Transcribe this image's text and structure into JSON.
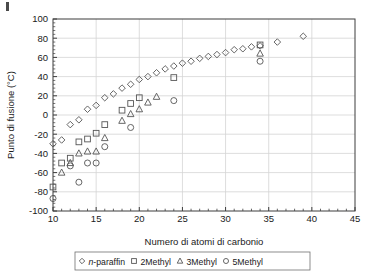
{
  "chart_data": {
    "type": "scatter",
    "title": "",
    "xlabel": "Numero di atomi di carbonio",
    "ylabel": "Punto di fusione (°C)",
    "xlim": [
      10,
      45
    ],
    "ylim": [
      -100,
      100
    ],
    "xticks": [
      10,
      15,
      20,
      25,
      30,
      35,
      40,
      45
    ],
    "yticks": [
      -100,
      -80,
      -60,
      -40,
      -20,
      0,
      20,
      40,
      60,
      80,
      100
    ],
    "xtick_labels": [
      "10",
      "15",
      "20",
      "25",
      "30",
      "35",
      "40",
      "45"
    ],
    "ytick_labels": [
      "-100",
      "-80",
      "-60",
      "-40",
      "-20",
      "0",
      "20",
      "40",
      "60",
      "80",
      "100"
    ],
    "x_minor_tick_step": 1,
    "y_minor_tick_step": 4,
    "grid": true,
    "grid_color": "#d4d4d4",
    "legend_position": "below-axis",
    "marker_color": "#555555",
    "series": [
      {
        "name": "n-paraffin",
        "marker": "diamond",
        "points": [
          [
            10,
            -30
          ],
          [
            11,
            -26
          ],
          [
            12,
            -10
          ],
          [
            13,
            -5
          ],
          [
            14,
            6
          ],
          [
            15,
            10
          ],
          [
            16,
            18
          ],
          [
            17,
            22
          ],
          [
            18,
            28
          ],
          [
            19,
            32
          ],
          [
            20,
            37
          ],
          [
            21,
            40
          ],
          [
            22,
            44
          ],
          [
            23,
            48
          ],
          [
            24,
            51
          ],
          [
            25,
            54
          ],
          [
            26,
            56
          ],
          [
            27,
            59
          ],
          [
            28,
            61
          ],
          [
            29,
            63
          ],
          [
            30,
            65
          ],
          [
            31,
            68
          ],
          [
            32,
            69
          ],
          [
            33,
            71
          ],
          [
            34,
            72
          ],
          [
            36,
            76
          ],
          [
            39,
            82
          ]
        ]
      },
      {
        "name": "2Methyl",
        "marker": "square",
        "points": [
          [
            10,
            -75
          ],
          [
            11,
            -50
          ],
          [
            12,
            -45
          ],
          [
            13,
            -28
          ],
          [
            14,
            -25
          ],
          [
            15,
            -19
          ],
          [
            16,
            -10
          ],
          [
            18,
            5
          ],
          [
            19,
            12
          ],
          [
            20,
            18
          ],
          [
            24,
            39
          ],
          [
            34,
            73
          ]
        ]
      },
      {
        "name": "3Methyl",
        "marker": "triangle",
        "points": [
          [
            11,
            -60
          ],
          [
            12,
            -50
          ],
          [
            13,
            -40
          ],
          [
            14,
            -38
          ],
          [
            15,
            -38
          ],
          [
            16,
            -24
          ],
          [
            18,
            -6
          ],
          [
            19,
            1
          ],
          [
            20,
            6
          ],
          [
            21,
            13
          ],
          [
            22,
            19
          ],
          [
            34,
            64
          ]
        ]
      },
      {
        "name": "5Methyl",
        "marker": "circle",
        "points": [
          [
            10,
            -87
          ],
          [
            12,
            -53
          ],
          [
            13,
            -70
          ],
          [
            14,
            -50
          ],
          [
            15,
            -50
          ],
          [
            16,
            -33
          ],
          [
            19,
            -13
          ],
          [
            24,
            15
          ],
          [
            34,
            56
          ]
        ]
      }
    ]
  },
  "legend": {
    "items": [
      {
        "label_italic": "n",
        "label": "-paraffin",
        "marker": "diamond"
      },
      {
        "label": "2Methyl",
        "marker": "square"
      },
      {
        "label": "3Methyl",
        "marker": "triangle"
      },
      {
        "label": "5Methyl",
        "marker": "circle"
      }
    ]
  }
}
